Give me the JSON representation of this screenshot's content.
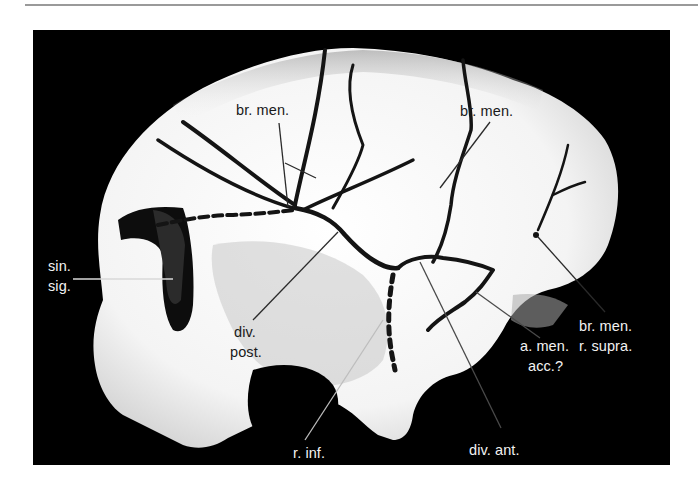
{
  "figure": {
    "colors": {
      "background": "#000000",
      "bone": "#f4f4f4",
      "vessel": "#141414",
      "leader_dark": "#2a2a2a",
      "leader_light": "#bdbdbd",
      "rule": "#9a9a9a"
    },
    "labels": [
      {
        "id": "br-men-left",
        "lines": [
          "br. men."
        ]
      },
      {
        "id": "br-men-right",
        "lines": [
          "br. men."
        ]
      },
      {
        "id": "sin-sig",
        "lines": [
          "sin.",
          "sig."
        ]
      },
      {
        "id": "div-post",
        "lines": [
          "div.",
          "post."
        ]
      },
      {
        "id": "r-inf",
        "lines": [
          "r. inf."
        ]
      },
      {
        "id": "div-ant",
        "lines": [
          "div. ant."
        ]
      },
      {
        "id": "a-men-acc",
        "lines": [
          "a. men.",
          "acc.?"
        ]
      },
      {
        "id": "br-men-r-supra",
        "lines": [
          "br. men.",
          "r. supra."
        ]
      }
    ]
  }
}
